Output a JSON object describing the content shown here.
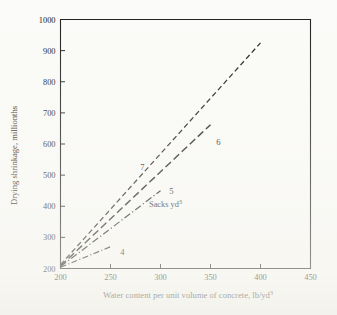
{
  "chart_data": {
    "type": "line",
    "title": "",
    "xlabel": "Water content per unit volume of concrete, lb/yd3",
    "xlabel_base": "Water content per unit volume of concrete, lb/yd",
    "xlabel_sup": "3",
    "ylabel": "Drying shrinkage, millionths",
    "xlim": [
      200,
      450
    ],
    "ylim": [
      200,
      1000
    ],
    "xticks": [
      200,
      250,
      300,
      350,
      400,
      450
    ],
    "yticks": [
      200,
      300,
      400,
      500,
      600,
      700,
      800,
      900,
      1000
    ],
    "xtick_labels": [
      "200",
      "250",
      "300",
      "350",
      "400",
      "450"
    ],
    "ytick_labels": [
      "200",
      "300",
      "400",
      "500",
      "600",
      "700",
      "800",
      "900",
      "1000"
    ],
    "grid": false,
    "legend_position": "inline-labels",
    "annotations": [
      {
        "name": "sacks-units-note",
        "text": "Sacks yd3",
        "text_base": "Sacks yd",
        "text_sup": "3",
        "x": 305,
        "y": 408
      }
    ],
    "series": [
      {
        "name": "7",
        "label": "7",
        "style": "dashed",
        "color": "#161616",
        "x": [
          200,
          400
        ],
        "y": [
          212,
          925
        ],
        "label_x": 282,
        "label_y": 525
      },
      {
        "name": "6",
        "label": "6",
        "style": "dashed",
        "color": "#161616",
        "x": [
          200,
          350
        ],
        "y": [
          208,
          662
        ],
        "label_x": 358,
        "label_y": 608
      },
      {
        "name": "5",
        "label": "5",
        "style": "dash-dot",
        "color": "#161616",
        "x": [
          200,
          300
        ],
        "y": [
          206,
          450
        ],
        "label_x": 311,
        "label_y": 450
      },
      {
        "name": "4",
        "label": "4",
        "style": "dash-dot",
        "color": "#161616",
        "x": [
          200,
          250
        ],
        "y": [
          204,
          270
        ],
        "label_x": 262,
        "label_y": 252
      }
    ]
  },
  "figure": {
    "caption": "",
    "background_color": "#fbfbf9",
    "ink_color": "#161616"
  }
}
